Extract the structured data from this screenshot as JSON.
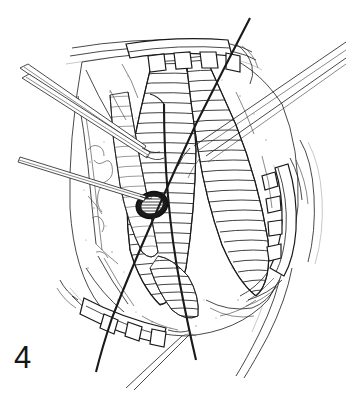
{
  "figure": {
    "number_label": "4",
    "caption_position": "bottom-left",
    "domain": "medical-surgical-illustration",
    "style": "black-and-white pen-and-ink line drawing",
    "background_color": "#ffffff",
    "ink_color": "#1a1a1a",
    "width_px": 347,
    "height_px": 396
  },
  "scene": {
    "title": "Operative field exposed by self-retaining toothed retractors",
    "description": "Surgical wound held open by three toothed retractor blades exposing hatched tubular anatomical structures, with a dark oval incision opening at center, forceps entering from the left and instruments from the upper right, crossed by dark suture strands."
  },
  "elements": {
    "retractor_top": {
      "name": "top retractor blade",
      "teeth_count": 4,
      "position": "top center"
    },
    "retractor_right": {
      "name": "right retractor blade",
      "teeth_count": 4,
      "position": "right edge"
    },
    "retractor_bottom": {
      "name": "bottom retractor blade",
      "teeth_count": 3,
      "position": "bottom center-left"
    },
    "incision": {
      "name": "oval incision opening",
      "shading": "dark cross-hatched interior",
      "position": "center left-of-middle"
    },
    "forceps_upper_left": {
      "name": "upper-left forceps shaft",
      "count": 2,
      "enters_from": "upper left"
    },
    "probe_left": {
      "name": "left probe tip",
      "count": 1,
      "enters_from": "middle left",
      "points_at": "oval incision opening"
    },
    "instruments_upper_right": {
      "name": "upper-right instrument shafts",
      "count": 3,
      "enters_from": "upper right"
    },
    "suture_main": {
      "name": "primary suture strand",
      "path": "top right down to bottom left"
    },
    "suture_secondary": {
      "name": "secondary suture strand",
      "path": "upper center down to bottom"
    },
    "tissue_mass": {
      "name": "exposed tissue bed",
      "texture": "stippled with fine specks"
    },
    "vessels": {
      "name": "hatched tubular structures",
      "count": 4,
      "texture": "dense parallel hatching"
    }
  }
}
